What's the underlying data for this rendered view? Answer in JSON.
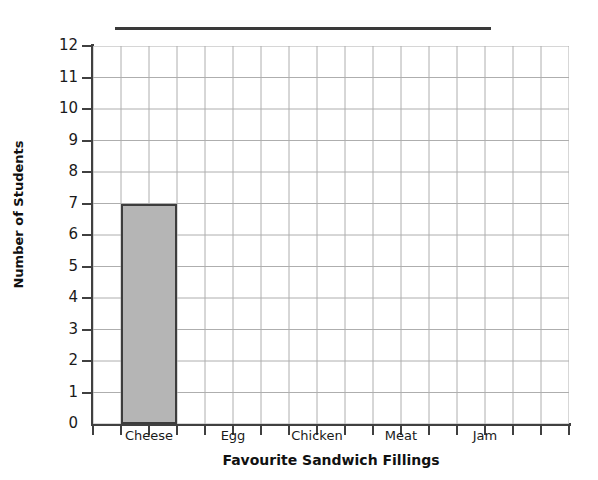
{
  "worksheet": {
    "title_rule_label": "",
    "title_placeholder": ""
  },
  "chart_data": {
    "type": "bar",
    "title": "",
    "xlabel": "Favourite Sandwich Fillings",
    "ylabel": "Number of Students",
    "categories": [
      "Cheese",
      "Egg",
      "Chicken",
      "Meat",
      "Jam"
    ],
    "values": [
      7,
      0,
      0,
      0,
      0
    ],
    "ylim": [
      0,
      12
    ],
    "ytick_labels": [
      "12",
      "11",
      "10",
      "9",
      "8",
      "7",
      "6",
      "5",
      "4",
      "3",
      "2",
      "1",
      "0"
    ],
    "ytick_values": [
      12,
      11,
      10,
      9,
      8,
      7,
      6,
      5,
      4,
      3,
      2,
      1,
      0
    ],
    "grid": true,
    "grid_columns": 17,
    "legend": "none",
    "bar_fill_color": "#b5b5b5",
    "bar_border_color": "#3d3d3d",
    "axis_color": "#404040",
    "grid_color": "#aeaeae",
    "category_slots": [
      {
        "label": "Cheese",
        "start_col": 1,
        "end_col": 3
      },
      {
        "label": "Egg",
        "start_col": 4,
        "end_col": 6
      },
      {
        "label": "Chicken",
        "start_col": 7,
        "end_col": 9
      },
      {
        "label": "Meat",
        "start_col": 10,
        "end_col": 12
      },
      {
        "label": "Jam",
        "start_col": 13,
        "end_col": 15
      }
    ]
  }
}
